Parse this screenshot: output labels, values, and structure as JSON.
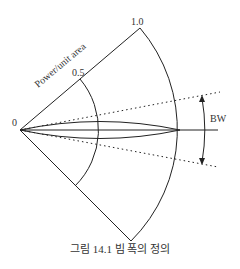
{
  "figure": {
    "axis_label": "Power/unit area",
    "tick_full": "1.0",
    "tick_half": "0.5",
    "origin_label": "0",
    "bw_label": "BW",
    "caption": "그림 14.1 빔 폭의 정의"
  }
}
